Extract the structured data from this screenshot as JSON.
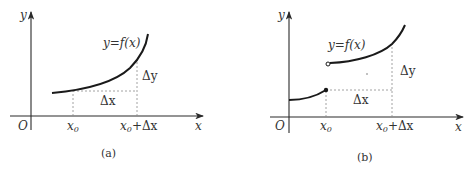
{
  "figure_a": {
    "caption": "(a)",
    "origin_label": "O",
    "x_axis_label": "x",
    "y_axis_label": "y",
    "curve_label": "y=f(x)",
    "x0_label": "x",
    "x0_sub": "0",
    "x0_dx_label": "x",
    "x0_dx_sub": "0",
    "x0_dx_rest": "+Δx",
    "delta_x_label": "Δx",
    "delta_y_label": "Δy",
    "description": "Continuous increasing curve; Δx and Δy shown between x0 and x0+Δx"
  },
  "figure_b": {
    "caption": "(b)",
    "origin_label": "O",
    "x_axis_label": "x",
    "y_axis_label": "y",
    "curve_label": "y=f(x)",
    "x0_label": "x",
    "x0_sub": "0",
    "x0_dx_label": "x",
    "x0_dx_sub": "0",
    "x0_dx_rest": "+Δx",
    "delta_x_label": "Δx",
    "delta_y_label": "Δy",
    "description": "Curve with jump discontinuity at x0 (filled dot on lower piece, open circle on upper piece)"
  },
  "colors": {
    "line": "#1a1a1a",
    "dashed": "#8a8a8a",
    "text": "#333333"
  }
}
